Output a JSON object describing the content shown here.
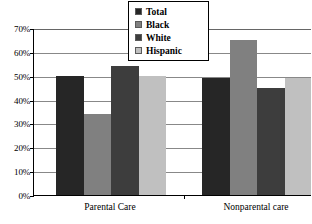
{
  "chart_data": {
    "type": "bar",
    "title": "",
    "subtitle": "",
    "xlabel": "",
    "ylabel": "",
    "categories": [
      "Parental Care",
      "Nonparental care"
    ],
    "series": [
      {
        "name": "Total",
        "color": "#262626",
        "values": [
          50,
          49
        ]
      },
      {
        "name": "Black",
        "color": "#808080",
        "values": [
          34,
          65
        ]
      },
      {
        "name": "White",
        "color": "#3d3d3d",
        "values": [
          54,
          45
        ]
      },
      {
        "name": "Hispanic",
        "color": "#c0c0c0",
        "values": [
          50,
          49
        ]
      }
    ],
    "ylim": [
      0,
      70
    ],
    "ytick_values": [
      0,
      10,
      20,
      30,
      40,
      50,
      60,
      70
    ],
    "ytick_labels": [
      "0%",
      "10%",
      "20%",
      "30%",
      "40%",
      "50%",
      "60%",
      "70%"
    ],
    "ytick_format": "percent",
    "grid": true,
    "grid_axis": "y",
    "legend": {
      "position": "top-center",
      "border": true,
      "entries": [
        "Total",
        "Black",
        "White",
        "Hispanic"
      ]
    }
  },
  "axis": {
    "y_labels": [
      "70%",
      "60%",
      "50%",
      "40%",
      "30%",
      "20%",
      "10%",
      "0%"
    ],
    "x_labels": [
      "Parental Care",
      "Nonparental care"
    ]
  },
  "legend": {
    "items": [
      {
        "label": "Total"
      },
      {
        "label": "Black"
      },
      {
        "label": "White"
      },
      {
        "label": "Hispanic"
      }
    ]
  }
}
